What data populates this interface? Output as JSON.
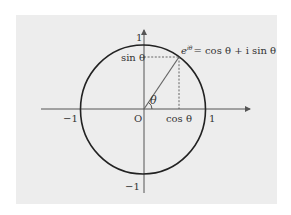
{
  "diagram": {
    "formula": "e^{iθ} = cos θ + i sin θ",
    "formula_parts": {
      "base": "e",
      "exponent": "iθ",
      "rhs": "= cos θ + i sin θ"
    },
    "labels": {
      "origin": "O",
      "x_pos": "1",
      "x_neg": "−1",
      "y_pos": "1",
      "y_neg": "−1",
      "angle": "θ",
      "cos": "cos θ",
      "sin": "sin θ"
    },
    "colors": {
      "background": "#ededed",
      "axis": "#555555",
      "circle": "#222222",
      "radius": "#666666",
      "projection": "#555555"
    }
  }
}
